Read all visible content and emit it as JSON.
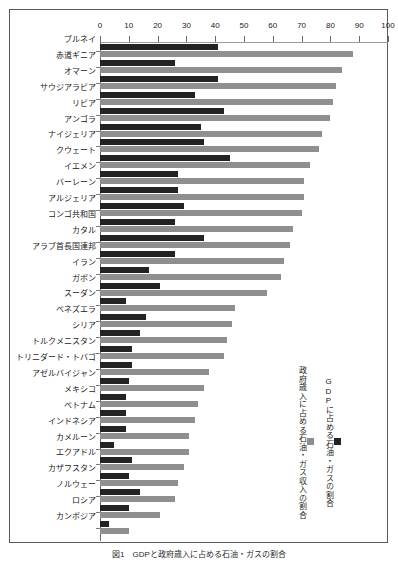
{
  "figure": {
    "caption": "図1　GDPと政府歳入に占める石油・ガスの割合"
  },
  "legend": {
    "items": [
      {
        "label": "GDPに占める石油・ガスの割合",
        "color": "#232323",
        "key": "gdp"
      },
      {
        "label": "政府歳入に占める石油・ガス収入の割合",
        "color": "#8f8f8f",
        "key": "revenue"
      }
    ]
  },
  "chart_data": {
    "type": "bar",
    "orientation": "horizontal",
    "title": "",
    "xlabel": "",
    "ylabel": "",
    "xlim": [
      0,
      100
    ],
    "xticks": [
      0,
      10,
      20,
      30,
      40,
      50,
      60,
      70,
      80,
      90,
      100
    ],
    "grid": false,
    "legend_position": "right",
    "categories": [
      "ブルネイ",
      "赤道ギニア",
      "オマーン",
      "サウジアラビア",
      "リビア",
      "アンゴラ",
      "ナイジェリア",
      "クウェート",
      "イエメン",
      "バーレーン",
      "アルジェリア",
      "コンゴ共和国",
      "カタル",
      "アラブ首長国連邦",
      "イラン",
      "ガボン",
      "スーダン",
      "ベネズエラ",
      "シリア",
      "トルクメニスタン",
      "トリニダード・トバゴ",
      "アゼルバイジャン",
      "メキシコ",
      "ベトナム",
      "インドネシア",
      "カメルーン",
      "エクアドル",
      "カザフスタン",
      "ノルウェー",
      "ロシア",
      "カンボジア"
    ],
    "series": [
      {
        "name": "GDPに占める石油・ガスの割合",
        "color": "#232323",
        "values": [
          41,
          26,
          41,
          33,
          43,
          35,
          36,
          45,
          27,
          27,
          29,
          26,
          36,
          26,
          17,
          21,
          9,
          16,
          14,
          11,
          11,
          10,
          9,
          9,
          9,
          5,
          11,
          10,
          14,
          10,
          3
        ]
      },
      {
        "name": "政府歳入に占める石油・ガス収入の割合",
        "color": "#8f8f8f",
        "values": [
          88,
          84,
          82,
          81,
          80,
          77,
          76,
          73,
          71,
          71,
          70,
          67,
          66,
          64,
          63,
          58,
          47,
          46,
          44,
          43,
          38,
          36,
          34,
          33,
          31,
          31,
          29,
          27,
          26,
          21,
          10
        ]
      }
    ]
  }
}
